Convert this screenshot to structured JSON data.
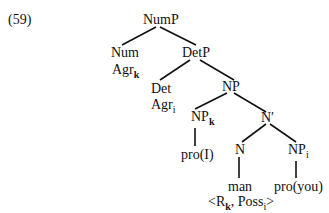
{
  "example_number": "(59)",
  "nodes": {
    "nump": "NumP",
    "num": "Num",
    "agr_k_base": "Agr",
    "agr_k_sub": "k",
    "detp": "DetP",
    "det": "Det",
    "agr_i_base": "Agr",
    "agr_i_sub": "i",
    "np": "NP",
    "npk_base": "NP",
    "npk_sub": "k",
    "proI": "pro(I)",
    "nbar": "N′",
    "n": "N",
    "man": "man",
    "npi_base": "NP",
    "npi_sub": "i",
    "proyou": "pro(you)",
    "feat_open": "<R",
    "feat_k": "k",
    "feat_mid": ", Poss",
    "feat_i": "i",
    "feat_close": ">"
  }
}
